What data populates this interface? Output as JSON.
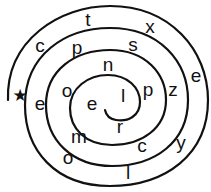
{
  "puzzle": {
    "type": "spiral-letter-puzzle",
    "start_marker": {
      "icon": "star-icon",
      "glyph": "★",
      "x": 20,
      "y": 95
    },
    "colors": {
      "ink": "#111111",
      "background": "#ffffff"
    },
    "letters": [
      {
        "char": "c",
        "x": 40,
        "y": 45,
        "band": "outer"
      },
      {
        "char": "t",
        "x": 88,
        "y": 19,
        "band": "outer"
      },
      {
        "char": "x",
        "x": 150,
        "y": 26,
        "band": "outer"
      },
      {
        "char": "e",
        "x": 196,
        "y": 75,
        "band": "outer"
      },
      {
        "char": "y",
        "x": 181,
        "y": 142,
        "band": "outer"
      },
      {
        "char": "l",
        "x": 128,
        "y": 172,
        "band": "outer"
      },
      {
        "char": "o",
        "x": 68,
        "y": 157,
        "band": "outer"
      },
      {
        "char": "e",
        "x": 40,
        "y": 103,
        "band": "second"
      },
      {
        "char": "p",
        "x": 77,
        "y": 47,
        "band": "second"
      },
      {
        "char": "s",
        "x": 133,
        "y": 44,
        "band": "second"
      },
      {
        "char": "z",
        "x": 173,
        "y": 89,
        "band": "second"
      },
      {
        "char": "c",
        "x": 142,
        "y": 145,
        "band": "second"
      },
      {
        "char": "m",
        "x": 79,
        "y": 136,
        "band": "second"
      },
      {
        "char": "o",
        "x": 67,
        "y": 90,
        "band": "third"
      },
      {
        "char": "n",
        "x": 108,
        "y": 64,
        "band": "third"
      },
      {
        "char": "p",
        "x": 148,
        "y": 89,
        "band": "third"
      },
      {
        "char": "r",
        "x": 120,
        "y": 126,
        "band": "third"
      },
      {
        "char": "e",
        "x": 92,
        "y": 103,
        "band": "inner"
      },
      {
        "char": "l",
        "x": 123,
        "y": 95,
        "band": "inner"
      }
    ]
  }
}
